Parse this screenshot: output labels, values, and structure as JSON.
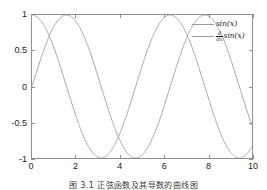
{
  "figure": {
    "caption": "图 3.1 正弦函数及其导数的曲线图"
  },
  "axes": {
    "xticks": [
      "0",
      "2",
      "4",
      "6",
      "8",
      "10"
    ],
    "yticks": [
      "1",
      "0.5",
      "0",
      "-0.5",
      "-1"
    ],
    "xlabel": "",
    "ylabel": "",
    "axis_color": "#8f8f8f",
    "grid": false
  },
  "legend": {
    "position": "upper-right",
    "entries": [
      {
        "label": "sin(x)",
        "math": {
          "type": "plain",
          "text": "sin(",
          "var": "x",
          "tail": ")"
        },
        "color": "#9a9a9a"
      },
      {
        "label": "d/dx sin(x)",
        "math": {
          "type": "fraction",
          "numerator": "d",
          "denominator": "dx",
          "text": "sin(",
          "var": "x",
          "tail": ")"
        },
        "color": "#9a9a9a"
      }
    ]
  },
  "chart_data": {
    "type": "line",
    "title": "",
    "xlabel": "",
    "ylabel": "",
    "xlim": [
      0,
      10
    ],
    "ylim": [
      -1,
      1
    ],
    "xticks": [
      0,
      2,
      4,
      6,
      8,
      10
    ],
    "yticks": [
      -1,
      -0.5,
      0,
      0.5,
      1
    ],
    "grid": false,
    "legend_position": "upper right",
    "series": [
      {
        "name": "sin(x)",
        "color": "#9a9a9a",
        "x": [
          0,
          0.25,
          0.5,
          0.75,
          1,
          1.25,
          1.5,
          1.5708,
          1.75,
          2,
          2.25,
          2.5,
          2.75,
          3,
          3.1416,
          3.25,
          3.5,
          3.75,
          4,
          4.25,
          4.5,
          4.7124,
          4.75,
          5,
          5.25,
          5.5,
          5.75,
          6,
          6.2832,
          6.5,
          6.75,
          7,
          7.25,
          7.5,
          7.75,
          7.854,
          8,
          8.25,
          8.5,
          8.75,
          9,
          9.25,
          9.4248,
          9.5,
          9.75,
          10
        ],
        "y": [
          0,
          0.2474,
          0.4794,
          0.6816,
          0.8415,
          0.949,
          0.9975,
          1,
          0.9839,
          0.9093,
          0.7781,
          0.5985,
          0.3817,
          0.1411,
          0,
          -0.1082,
          -0.3508,
          -0.5716,
          -0.7568,
          -0.895,
          -0.9775,
          -1,
          -0.9995,
          -0.9589,
          -0.8589,
          -0.7055,
          -0.5074,
          -0.2794,
          0,
          0.2151,
          0.429,
          0.657,
          0.8137,
          0.938,
          0.9938,
          1,
          0.9894,
          0.9037,
          0.7985,
          0.6313,
          0.4121,
          0.1674,
          0,
          -0.0752,
          -0.3131,
          -0.544
        ]
      },
      {
        "name": "d/dx sin(x)",
        "color": "#9a9a9a",
        "x": [
          0,
          0.25,
          0.5,
          0.75,
          1,
          1.25,
          1.5,
          1.5708,
          1.75,
          2,
          2.25,
          2.5,
          2.75,
          3,
          3.1416,
          3.25,
          3.5,
          3.75,
          4,
          4.25,
          4.5,
          4.7124,
          4.75,
          5,
          5.25,
          5.5,
          5.75,
          6,
          6.2832,
          6.5,
          6.75,
          7,
          7.25,
          7.5,
          7.75,
          7.854,
          8,
          8.25,
          8.5,
          8.75,
          9,
          9.25,
          9.4248,
          9.5,
          9.75,
          10
        ],
        "y": [
          1,
          0.9689,
          0.8776,
          0.7317,
          0.5403,
          0.3153,
          0.0707,
          0,
          -0.1782,
          -0.4161,
          -0.6282,
          -0.8011,
          -0.9243,
          -0.99,
          -1,
          -0.9941,
          -0.9365,
          -0.8206,
          -0.6536,
          -0.4461,
          -0.2108,
          0,
          0.0332,
          0.2837,
          0.5121,
          0.7087,
          0.8618,
          0.9602,
          1,
          0.9766,
          0.9035,
          0.7539,
          0.5813,
          0.3466,
          0.1106,
          0,
          -0.1455,
          -0.4283,
          -0.602,
          -0.7755,
          -0.9111,
          -0.9859,
          -1,
          -0.9972,
          -0.9497,
          -0.8391
        ]
      }
    ]
  }
}
